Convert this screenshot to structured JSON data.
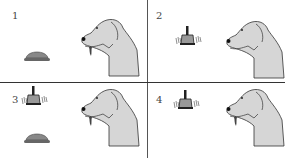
{
  "figure": {
    "panels": [
      {
        "number": "1",
        "stimuli": [
          "food-bowl"
        ],
        "dog_salivating": true
      },
      {
        "number": "2",
        "stimuli": [
          "bell"
        ],
        "dog_salivating": false
      },
      {
        "number": "3",
        "stimuli": [
          "bell",
          "food-bowl"
        ],
        "dog_salivating": true
      },
      {
        "number": "4",
        "stimuli": [
          "bell"
        ],
        "dog_salivating": true
      }
    ]
  },
  "colors": {
    "dog_fill": "#d6d6d6",
    "outline": "#333333",
    "bowl": "#777777",
    "divider": "#444444"
  }
}
